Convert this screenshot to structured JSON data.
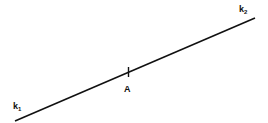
{
  "diagram": {
    "line": {
      "x1": 15,
      "y1": 121,
      "x2": 255,
      "y2": 18,
      "color": "#111111"
    },
    "point": {
      "label": "A",
      "x": 128,
      "y": 72
    },
    "labels": {
      "start": {
        "main": "k",
        "sub": "1"
      },
      "end": {
        "main": "k",
        "sub": "2"
      }
    }
  }
}
